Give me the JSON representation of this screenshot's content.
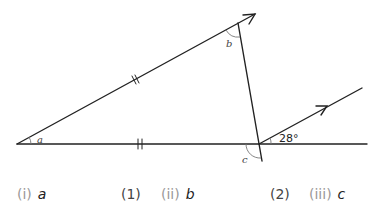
{
  "diagram": {
    "angle_labels": {
      "a": "a",
      "b": "b",
      "c": "c",
      "given": "28°"
    },
    "stroke_color": "#222222",
    "arc_color": "#777777"
  },
  "questions": [
    {
      "number": "(i)",
      "variable": "a",
      "marks": "(1)"
    },
    {
      "number": "(ii)",
      "variable": "b",
      "marks": "(2)"
    },
    {
      "number": "(iii)",
      "variable": "c"
    }
  ]
}
